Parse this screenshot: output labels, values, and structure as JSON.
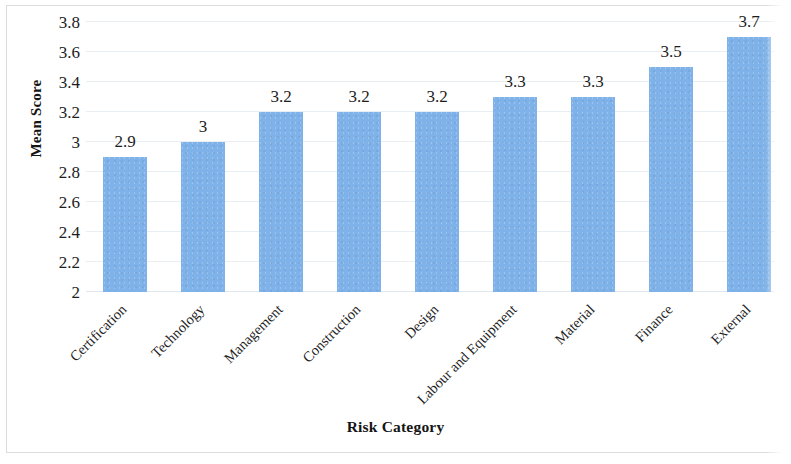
{
  "chart_data": {
    "type": "bar",
    "title": "",
    "xlabel": "Risk Category",
    "ylabel": "Mean Score",
    "categories": [
      "Certification",
      "Technology",
      "Management",
      "Construction",
      "Design",
      "Labour and Equipment",
      "Material",
      "Finance",
      "External"
    ],
    "values": [
      2.9,
      3,
      3.2,
      3.2,
      3.2,
      3.3,
      3.3,
      3.5,
      3.7
    ],
    "data_labels": [
      "2.9",
      "3",
      "3.2",
      "3.2",
      "3.2",
      "3.3",
      "3.3",
      "3.5",
      "3.7"
    ],
    "ylim": [
      2,
      3.8
    ],
    "ytick_labels": [
      "2",
      "2.2",
      "2.4",
      "2.6",
      "2.8",
      "3",
      "3.2",
      "3.4",
      "3.6",
      "3.8"
    ],
    "ytick_values": [
      2,
      2.2,
      2.4,
      2.6,
      2.8,
      3,
      3.2,
      3.4,
      3.6,
      3.8
    ],
    "grid": true,
    "legend": false,
    "bar_color": "#7fb2e8",
    "gridline_color": "#e9eef3",
    "text_color": "#1d1d1d",
    "xtick_rotation": -45
  }
}
